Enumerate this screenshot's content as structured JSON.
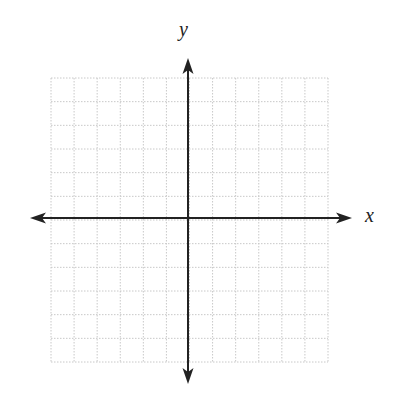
{
  "diagram": {
    "type": "coordinate-plane",
    "x_axis_label": "x",
    "y_axis_label": "y",
    "grid": {
      "columns": 12,
      "rows": 12,
      "left": 51,
      "top": 78,
      "right": 328,
      "bottom": 362,
      "line_style": "dotted",
      "line_color": "#c8c8c8"
    },
    "axes": {
      "origin_x": 188,
      "origin_y": 218,
      "x_arrow_left": 30,
      "x_arrow_right": 352,
      "y_arrow_top": 58,
      "y_arrow_bottom": 384,
      "color": "#222222"
    }
  }
}
